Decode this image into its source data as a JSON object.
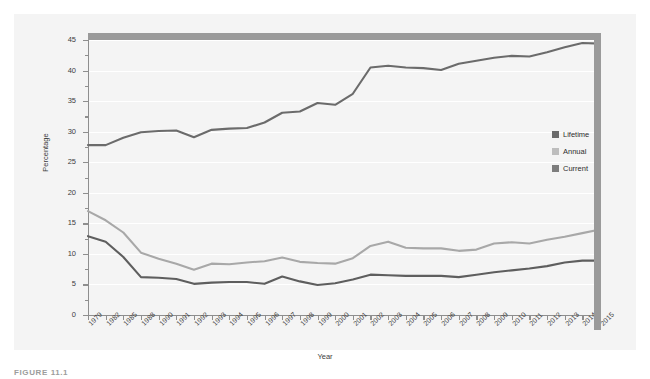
{
  "figure": {
    "caption": "FIGURE 11.1"
  },
  "chart_data": {
    "type": "line",
    "title": "",
    "xlabel": "Year",
    "ylabel": "Percentage",
    "ylim": [
      0,
      45
    ],
    "yticks": [
      0,
      5,
      10,
      15,
      20,
      25,
      30,
      35,
      40,
      45
    ],
    "grid": true,
    "legend_position": "right",
    "categories": [
      "1979",
      "1982",
      "1985",
      "1988",
      "1990",
      "1991",
      "1992",
      "1993",
      "1994",
      "1995",
      "1996",
      "1997",
      "1998",
      "1999",
      "2000",
      "2001",
      "2002",
      "2003",
      "2004",
      "2005",
      "2006",
      "2007",
      "2008",
      "2009",
      "2010",
      "2011",
      "2012",
      "2013",
      "2014",
      "2015"
    ],
    "series": [
      {
        "name": "Lifetime",
        "color": "#6b6b6b",
        "values": [
          27.8,
          27.8,
          29.0,
          29.9,
          30.1,
          30.2,
          29.1,
          30.3,
          30.5,
          30.6,
          31.5,
          33.1,
          33.3,
          34.7,
          34.4,
          36.2,
          40.5,
          40.8,
          40.5,
          40.4,
          40.1,
          41.1,
          41.6,
          42.1,
          42.4,
          42.3,
          43.0,
          43.8,
          44.5,
          44.4
        ]
      },
      {
        "name": "Annual",
        "color": "#a8a8a8",
        "values": [
          17.0,
          15.5,
          13.5,
          10.2,
          9.2,
          8.4,
          7.4,
          8.4,
          8.3,
          8.6,
          8.8,
          9.4,
          8.7,
          8.5,
          8.4,
          9.3,
          11.3,
          12.0,
          11.0,
          10.9,
          10.9,
          10.5,
          10.7,
          11.7,
          11.9,
          11.7,
          12.3,
          12.8,
          13.4,
          14.0
        ]
      },
      {
        "name": "Current",
        "color": "#5e5e5e",
        "values": [
          12.9,
          12.0,
          9.5,
          6.2,
          6.1,
          5.9,
          5.1,
          5.3,
          5.4,
          5.4,
          5.1,
          6.3,
          5.5,
          4.9,
          5.2,
          5.8,
          6.6,
          6.5,
          6.4,
          6.4,
          6.4,
          6.2,
          6.6,
          7.0,
          7.3,
          7.6,
          8.0,
          8.6,
          8.9,
          8.9
        ]
      }
    ]
  },
  "legend": {
    "items": [
      {
        "label": "Lifetime",
        "color": "#6b6b6b"
      },
      {
        "label": "Annual",
        "color": "#bdbdbd"
      },
      {
        "label": "Current",
        "color": "#7d7d7d"
      }
    ]
  }
}
